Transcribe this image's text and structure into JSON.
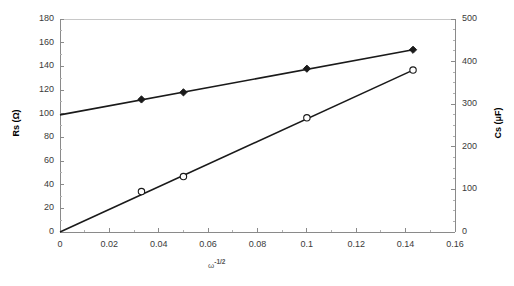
{
  "chart_data": {
    "type": "line",
    "title": "",
    "xlabel": "ω -1/2",
    "xlabel_base": "ω",
    "xlabel_exponent": "-1/2",
    "ylabel": "Rs (Ω)",
    "ylabel_right": "Cs (μF)",
    "xlim": [
      0,
      0.16
    ],
    "ylim": [
      0,
      180
    ],
    "ylim_right": [
      0,
      500
    ],
    "xticks": [
      "0",
      "0.02",
      "0.04",
      "0.06",
      "0.08",
      "0.1",
      "0.12",
      "0.14",
      "0.16"
    ],
    "xtick_values": [
      0,
      0.02,
      0.04,
      0.06,
      0.08,
      0.1,
      0.12,
      0.14,
      0.16
    ],
    "yticks": [
      "0",
      "20",
      "40",
      "60",
      "80",
      "100",
      "120",
      "140",
      "160",
      "180"
    ],
    "ytick_values": [
      0,
      20,
      40,
      60,
      80,
      100,
      120,
      140,
      160,
      180
    ],
    "yticks_right": [
      "0",
      "100",
      "200",
      "300",
      "400",
      "500"
    ],
    "ytick_right_values": [
      0,
      100,
      200,
      300,
      400,
      500
    ],
    "grid": false,
    "legend": "none",
    "series": [
      {
        "name": "Rs (Ω)",
        "axis": "left",
        "marker": "filled-diamond",
        "color": "#1a1a1a",
        "x": [
          0.033,
          0.05,
          0.1,
          0.143
        ],
        "values": [
          112,
          118,
          138,
          154
        ],
        "intercept": 99,
        "line_x": [
          0,
          0.143
        ],
        "line_y": [
          99,
          154
        ]
      },
      {
        "name": "Cs (μF)",
        "axis": "right",
        "marker": "open-circle",
        "color": "#1a1a1a",
        "x": [
          0.033,
          0.05,
          0.1,
          0.143
        ],
        "values": [
          95,
          130,
          268,
          380
        ],
        "intercept": 0,
        "line_x": [
          0,
          0.143
        ],
        "line_y": [
          0,
          380
        ]
      }
    ]
  }
}
